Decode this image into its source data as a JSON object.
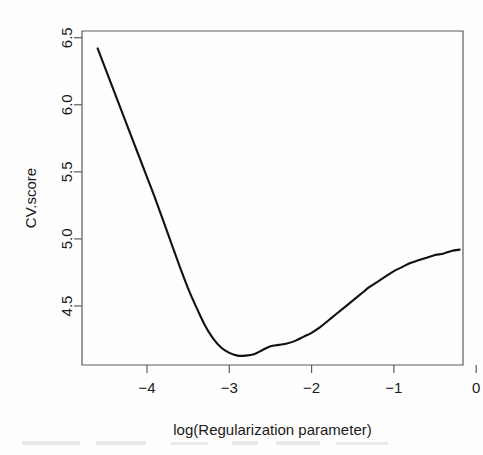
{
  "chart_data": {
    "type": "line",
    "title": "",
    "xlabel": "log(Regularization parameter)",
    "ylabel": "CV.score",
    "xlim": [
      -4.79,
      -0.16
    ],
    "ylim": [
      4.06,
      6.55
    ],
    "xticks": [
      -4,
      -3,
      -2,
      -1,
      0
    ],
    "xtick_labels": [
      "−4",
      "−3",
      "−2",
      "−1",
      "0"
    ],
    "yticks": [
      4.5,
      5.0,
      5.5,
      6.0,
      6.5
    ],
    "ytick_labels": [
      "4.5",
      "5.0",
      "5.5",
      "6.0",
      "6.5"
    ],
    "grid": false,
    "legend": null,
    "series": [
      {
        "name": "CV.score",
        "color": "#111111",
        "x": [
          -4.6,
          -4.5,
          -4.4,
          -4.3,
          -4.2,
          -4.1,
          -4.0,
          -3.9,
          -3.8,
          -3.7,
          -3.6,
          -3.5,
          -3.4,
          -3.3,
          -3.2,
          -3.1,
          -3.0,
          -2.9,
          -2.8,
          -2.7,
          -2.6,
          -2.5,
          -2.4,
          -2.3,
          -2.2,
          -2.1,
          -2.0,
          -1.9,
          -1.8,
          -1.7,
          -1.6,
          -1.5,
          -1.4,
          -1.3,
          -1.2,
          -1.1,
          -1.0,
          -0.9,
          -0.8,
          -0.7,
          -0.6,
          -0.5,
          -0.4,
          -0.3,
          -0.2
        ],
        "y": [
          6.42,
          6.26,
          6.1,
          5.94,
          5.78,
          5.62,
          5.46,
          5.3,
          5.13,
          4.96,
          4.79,
          4.63,
          4.49,
          4.36,
          4.26,
          4.19,
          4.15,
          4.13,
          4.13,
          4.14,
          4.17,
          4.2,
          4.21,
          4.22,
          4.24,
          4.27,
          4.3,
          4.34,
          4.39,
          4.44,
          4.49,
          4.54,
          4.59,
          4.64,
          4.68,
          4.72,
          4.76,
          4.79,
          4.82,
          4.84,
          4.86,
          4.88,
          4.89,
          4.91,
          4.92
        ]
      }
    ]
  },
  "figure": {
    "plot_left_px": 82,
    "plot_right_px": 463,
    "plot_top_px": 31,
    "plot_bottom_px": 365
  }
}
